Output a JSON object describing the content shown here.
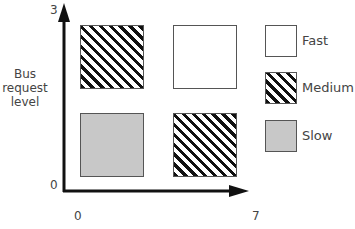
{
  "diagram": {
    "y_axis": {
      "label_lines": [
        "Bus",
        "request",
        "level"
      ],
      "tick_top": "3",
      "tick_bottom": "0"
    },
    "x_axis": {
      "tick_left": "0",
      "tick_right": "7"
    },
    "cells": [
      {
        "position": "top-left",
        "category": "Medium",
        "fill": "hatched"
      },
      {
        "position": "top-right",
        "category": "Fast",
        "fill": "white"
      },
      {
        "position": "bottom-left",
        "category": "Slow",
        "fill": "gray"
      },
      {
        "position": "bottom-right",
        "category": "Medium",
        "fill": "hatched"
      }
    ],
    "legend": [
      {
        "label": "Fast",
        "fill": "white"
      },
      {
        "label": "Medium",
        "fill": "hatched"
      },
      {
        "label": "Slow",
        "fill": "gray"
      }
    ],
    "colors": {
      "axis": "#111111",
      "slow_fill": "#c8c8c8",
      "hatch": "#111111",
      "border": "#555555"
    }
  }
}
